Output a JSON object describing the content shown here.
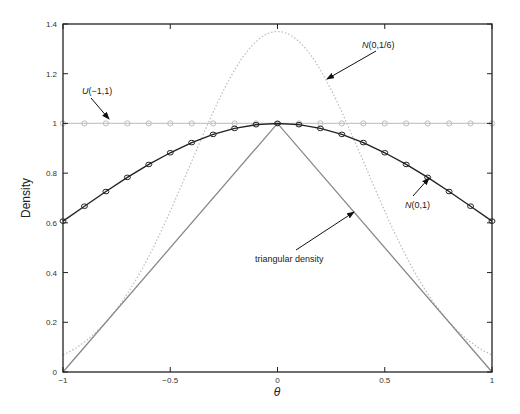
{
  "chart_data": {
    "type": "line",
    "title": "",
    "xlabel": "θ",
    "ylabel": "Density",
    "xlim": [
      -1,
      1
    ],
    "ylim": [
      0,
      1.4
    ],
    "xticks": [
      -1,
      -0.5,
      0,
      0.5,
      1
    ],
    "xtick_labels": [
      "−1",
      "−0.5",
      "0",
      "0.5",
      "1"
    ],
    "yticks": [
      0,
      0.2,
      0.4,
      0.6,
      0.8,
      1,
      1.2,
      1.4
    ],
    "ytick_labels": [
      "0",
      "0.2",
      "0.4",
      "0.6",
      "0.8",
      "1",
      "1.2",
      "1.4"
    ],
    "grid": false,
    "legend": "none (inline annotations with arrows)",
    "series": [
      {
        "name": "U(−1,1)",
        "style": "light gray line with circle markers",
        "color": "#c8c8c8",
        "x": [
          -1,
          -0.9,
          -0.8,
          -0.7,
          -0.6,
          -0.5,
          -0.4,
          -0.3,
          -0.2,
          -0.1,
          0,
          0.1,
          0.2,
          0.3,
          0.4,
          0.5,
          0.6,
          0.7,
          0.8,
          0.9,
          1
        ],
        "values": [
          1,
          1,
          1,
          1,
          1,
          1,
          1,
          1,
          1,
          1,
          1,
          1,
          1,
          1,
          1,
          1,
          1,
          1,
          1,
          1,
          1
        ]
      },
      {
        "name": "N(0,1)",
        "style": "black line with circle markers (scaled to 1 at θ=0)",
        "color": "#222222",
        "x": [
          -1,
          -0.9,
          -0.8,
          -0.7,
          -0.6,
          -0.5,
          -0.4,
          -0.3,
          -0.2,
          -0.1,
          0,
          0.1,
          0.2,
          0.3,
          0.4,
          0.5,
          0.6,
          0.7,
          0.8,
          0.9,
          1
        ],
        "values": [
          0.607,
          0.667,
          0.726,
          0.783,
          0.835,
          0.882,
          0.923,
          0.956,
          0.98,
          0.995,
          1.0,
          0.995,
          0.98,
          0.956,
          0.923,
          0.882,
          0.835,
          0.783,
          0.726,
          0.667,
          0.607
        ]
      },
      {
        "name": "N(0,1/6)",
        "style": "light gray dotted line",
        "color": "#bbbbbb",
        "x": [
          -1,
          -0.9,
          -0.8,
          -0.7,
          -0.6,
          -0.5,
          -0.4,
          -0.3,
          -0.2,
          -0.1,
          0,
          0.1,
          0.2,
          0.3,
          0.4,
          0.5,
          0.6,
          0.7,
          0.8,
          0.9,
          1
        ],
        "values": [
          0.068,
          0.12,
          0.2,
          0.31,
          0.46,
          0.64,
          0.84,
          1.03,
          1.2,
          1.32,
          1.37,
          1.32,
          1.2,
          1.03,
          0.84,
          0.64,
          0.46,
          0.31,
          0.2,
          0.12,
          0.068
        ]
      },
      {
        "name": "triangular density",
        "style": "gray solid line",
        "color": "#888888",
        "x": [
          -1,
          0,
          1
        ],
        "values": [
          0,
          1,
          0
        ]
      }
    ],
    "annotations": [
      {
        "text": "U(−1,1)",
        "italic_prefix": "U",
        "rest": "(−1,1)",
        "points_to": [
          -0.7,
          1.0
        ]
      },
      {
        "text": "N(0,1/6)",
        "italic_prefix": "N",
        "rest": "(0,1/6)",
        "points_to": [
          0.33,
          1.1
        ]
      },
      {
        "text": "N(0,1)",
        "italic_prefix": "N",
        "rest": "(0,1)",
        "points_to": [
          0.6,
          0.83
        ]
      },
      {
        "text": "triangular density",
        "italic_prefix": "",
        "rest": "triangular density",
        "points_to": [
          0.35,
          0.63
        ]
      }
    ]
  }
}
